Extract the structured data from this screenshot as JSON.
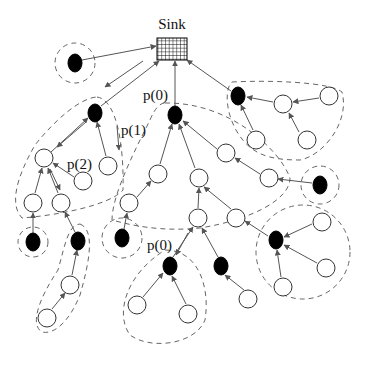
{
  "diagram": {
    "type": "sensor network clustering tree",
    "sink": {
      "label": "Sink",
      "x": 157,
      "y": 38,
      "w": 30,
      "h": 22
    },
    "labels": [
      {
        "id": "p0-top",
        "text": "p(0)",
        "x": 143,
        "y": 100
      },
      {
        "id": "p1",
        "text": "p(1)",
        "x": 121,
        "y": 135
      },
      {
        "id": "p2",
        "text": "p(2)",
        "x": 67,
        "y": 169
      },
      {
        "id": "p0-bottom",
        "text": "p(0)",
        "x": 147,
        "y": 250
      }
    ],
    "colors": {
      "black_node": "#000000",
      "white_node": "#ffffff",
      "edge": "#555555",
      "cluster_boundary": "#666666"
    },
    "nodes": [
      {
        "id": "iso",
        "kind": "black",
        "x": 75,
        "y": 63
      },
      {
        "id": "b1",
        "kind": "black",
        "x": 95,
        "y": 113
      },
      {
        "id": "w1",
        "kind": "white",
        "x": 44,
        "y": 158
      },
      {
        "id": "w2",
        "kind": "white",
        "x": 108,
        "y": 166
      },
      {
        "id": "w3",
        "kind": "white",
        "x": 83,
        "y": 181
      },
      {
        "id": "w4",
        "kind": "white",
        "x": 33,
        "y": 203
      },
      {
        "id": "w5",
        "kind": "white",
        "x": 61,
        "y": 203
      },
      {
        "id": "b2",
        "kind": "black",
        "x": 33,
        "y": 242
      },
      {
        "id": "b3",
        "kind": "black",
        "x": 78,
        "y": 241
      },
      {
        "id": "w6",
        "kind": "white",
        "x": 70,
        "y": 285
      },
      {
        "id": "w7",
        "kind": "white",
        "x": 47,
        "y": 318
      },
      {
        "id": "bm",
        "kind": "black",
        "x": 175,
        "y": 115
      },
      {
        "id": "w8",
        "kind": "white",
        "x": 158,
        "y": 174
      },
      {
        "id": "w9",
        "kind": "white",
        "x": 199,
        "y": 178
      },
      {
        "id": "w10",
        "kind": "white",
        "x": 226,
        "y": 153
      },
      {
        "id": "w11",
        "kind": "white",
        "x": 269,
        "y": 178
      },
      {
        "id": "w12",
        "kind": "white",
        "x": 129,
        "y": 203
      },
      {
        "id": "w13",
        "kind": "white",
        "x": 198,
        "y": 218
      },
      {
        "id": "w14",
        "kind": "white",
        "x": 236,
        "y": 218
      },
      {
        "id": "b4",
        "kind": "black",
        "x": 122,
        "y": 238
      },
      {
        "id": "b5",
        "kind": "black",
        "x": 170,
        "y": 266
      },
      {
        "id": "b6",
        "kind": "black",
        "x": 221,
        "y": 266
      },
      {
        "id": "w15",
        "kind": "white",
        "x": 137,
        "y": 305
      },
      {
        "id": "w16",
        "kind": "white",
        "x": 188,
        "y": 314
      },
      {
        "id": "w17",
        "kind": "white",
        "x": 248,
        "y": 299
      },
      {
        "id": "b7",
        "kind": "black",
        "x": 276,
        "y": 240
      },
      {
        "id": "w18",
        "kind": "white",
        "x": 322,
        "y": 222
      },
      {
        "id": "w19",
        "kind": "white",
        "x": 326,
        "y": 268
      },
      {
        "id": "w20",
        "kind": "white",
        "x": 283,
        "y": 287
      },
      {
        "id": "b8",
        "kind": "black",
        "x": 320,
        "y": 185
      },
      {
        "id": "bt",
        "kind": "black",
        "x": 238,
        "y": 96
      },
      {
        "id": "w21",
        "kind": "white",
        "x": 283,
        "y": 104
      },
      {
        "id": "w22",
        "kind": "white",
        "x": 329,
        "y": 96
      },
      {
        "id": "w23",
        "kind": "white",
        "x": 256,
        "y": 140
      },
      {
        "id": "w24",
        "kind": "white",
        "x": 307,
        "y": 140
      }
    ]
  }
}
